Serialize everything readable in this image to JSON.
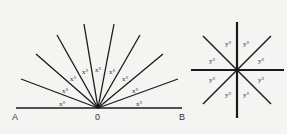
{
  "left_figure": {
    "points": {
      "A": "A",
      "O": "0",
      "B": "B"
    },
    "angle_label": "x°",
    "angle_count": 9,
    "line_color": "#1a1a1a"
  },
  "right_figure": {
    "angle_label": "y°",
    "angle_count": 8,
    "line_color": "#1a1a1a"
  },
  "background": "#f4f4f2"
}
